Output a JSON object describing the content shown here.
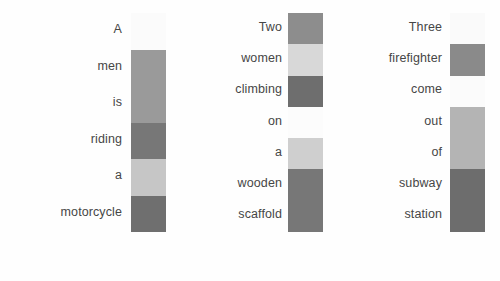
{
  "figure": {
    "background_color": "#fefefe",
    "text_color": "#464646",
    "columns": [
      {
        "id": "column-1",
        "words": [
          "A",
          "men",
          "is",
          "riding",
          "a",
          "motorcycle"
        ],
        "cell_colors": [
          "#fbfbfb",
          "#9a9a9a",
          "#9a9a9a",
          "#777777",
          "#c6c6c6",
          "#6f6f6f"
        ],
        "cell_values": [
          0.02,
          0.4,
          0.4,
          0.54,
          0.22,
          0.57
        ],
        "strip_label": "attention-strip-1"
      },
      {
        "id": "column-2",
        "words": [
          "Two",
          "women",
          "climbing",
          "on",
          "a",
          "wooden",
          "scaffold"
        ],
        "cell_colors": [
          "#8d8d8d",
          "#d8d8d8",
          "#6e6e6e",
          "#fcfcfc",
          "#cfcfcf",
          "#777777",
          "#777777"
        ],
        "cell_values": [
          0.45,
          0.15,
          0.57,
          0.01,
          0.19,
          0.54,
          0.54
        ],
        "strip_label": "attention-strip-2"
      },
      {
        "id": "column-3",
        "words": [
          "Three",
          "firefighter",
          "come",
          "out",
          "of",
          "subway",
          "station"
        ],
        "cell_colors": [
          "#fafafa",
          "#8a8a8a",
          "#fbfbfb",
          "#b4b4b4",
          "#b4b4b4",
          "#6d6d6d",
          "#6d6d6d"
        ],
        "cell_values": [
          0.02,
          0.46,
          0.02,
          0.29,
          0.29,
          0.58,
          0.58
        ],
        "strip_label": "attention-strip-3"
      }
    ]
  },
  "chart_data": {
    "type": "heatmap",
    "title": "",
    "xlabel": "",
    "ylabel": "",
    "colormap": "grayscale (light = low, dark = high)",
    "grid": false,
    "legend": "none",
    "columns": [
      {
        "name": "A men is riding a motorcycle",
        "categories": [
          "A",
          "men",
          "is",
          "riding",
          "a",
          "motorcycle"
        ],
        "values": [
          0.02,
          0.4,
          0.4,
          0.54,
          0.22,
          0.57
        ],
        "colors": [
          "#fbfbfb",
          "#9a9a9a",
          "#9a9a9a",
          "#777777",
          "#c6c6c6",
          "#6f6f6f"
        ]
      },
      {
        "name": "Two women climbing on a wooden scaffold",
        "categories": [
          "Two",
          "women",
          "climbing",
          "on",
          "a",
          "wooden",
          "scaffold"
        ],
        "values": [
          0.45,
          0.15,
          0.57,
          0.01,
          0.19,
          0.54,
          0.54
        ],
        "colors": [
          "#8d8d8d",
          "#d8d8d8",
          "#6e6e6e",
          "#fcfcfc",
          "#cfcfcf",
          "#777777",
          "#777777"
        ]
      },
      {
        "name": "Three firefighter come out of subway station",
        "categories": [
          "Three",
          "firefighter",
          "come",
          "out",
          "of",
          "subway",
          "station"
        ],
        "values": [
          0.02,
          0.46,
          0.02,
          0.29,
          0.29,
          0.58,
          0.58
        ],
        "colors": [
          "#fafafa",
          "#8a8a8a",
          "#fbfbfb",
          "#b4b4b4",
          "#b4b4b4",
          "#6d6d6d",
          "#6d6d6d"
        ]
      }
    ],
    "vlim": [
      0,
      1
    ]
  }
}
